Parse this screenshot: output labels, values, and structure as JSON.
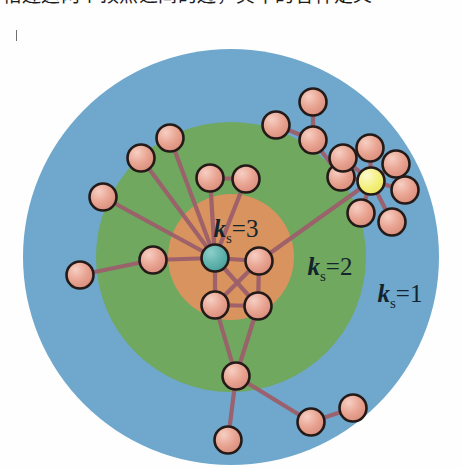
{
  "caption": {
    "text": "相连这两个顶点之间的边，其中的各种定义"
  },
  "figure": {
    "type": "k-shell decomposition network diagram",
    "title": "",
    "zones": [
      {
        "id": "shell-1",
        "label_k": "k",
        "label_sub": "s",
        "label_eq": "=1",
        "label_full": "k_s=1",
        "color": "#6fa8cc",
        "radius": 208,
        "label_x": 400,
        "label_y": 262
      },
      {
        "id": "shell-2",
        "label_k": "k",
        "label_sub": "s",
        "label_eq": "=2",
        "label_full": "k_s=2",
        "color": "#6fa85e",
        "radius": 135,
        "label_x": 330,
        "label_y": 235
      },
      {
        "id": "shell-3",
        "label_k": "k",
        "label_sub": "s",
        "label_eq": "=3",
        "label_full": "k_s=3",
        "color": "#d8935e",
        "radius": 63,
        "label_x": 236,
        "label_y": 197
      }
    ],
    "center": {
      "x": 231,
      "y": 217
    },
    "node_colors": {
      "normal_fill": "#e8a08e",
      "normal_highlight": "#f2c0b2",
      "center_fill": "#5fb2ad",
      "center_highlight": "#8fcdc9",
      "hub_fill": "#f4ef7a",
      "hub_highlight": "#f9f8c2",
      "stroke": "#241a18"
    },
    "edge_color": "#9d5f6b",
    "node_radius": 13.5,
    "nodes": [
      {
        "id": "n0",
        "x": 215,
        "y": 218,
        "kind": "center"
      },
      {
        "id": "n1",
        "x": 259,
        "y": 221,
        "kind": "normal"
      },
      {
        "id": "n2",
        "x": 215,
        "y": 265,
        "kind": "normal"
      },
      {
        "id": "n3",
        "x": 258,
        "y": 266,
        "kind": "normal"
      },
      {
        "id": "n4",
        "x": 153,
        "y": 220,
        "kind": "normal"
      },
      {
        "id": "n5",
        "x": 80,
        "y": 235,
        "kind": "normal"
      },
      {
        "id": "n6",
        "x": 103,
        "y": 157,
        "kind": "normal"
      },
      {
        "id": "n7",
        "x": 141,
        "y": 118,
        "kind": "normal"
      },
      {
        "id": "n8",
        "x": 170,
        "y": 98,
        "kind": "normal"
      },
      {
        "id": "n9",
        "x": 210,
        "y": 138,
        "kind": "normal"
      },
      {
        "id": "n10",
        "x": 246,
        "y": 139,
        "kind": "normal"
      },
      {
        "id": "n11",
        "x": 236,
        "y": 336,
        "kind": "normal"
      },
      {
        "id": "n12",
        "x": 228,
        "y": 400,
        "kind": "normal"
      },
      {
        "id": "n13",
        "x": 311,
        "y": 382,
        "kind": "normal"
      },
      {
        "id": "n14",
        "x": 353,
        "y": 368,
        "kind": "normal"
      },
      {
        "id": "n15",
        "x": 371,
        "y": 141,
        "kind": "hub"
      },
      {
        "id": "n16",
        "x": 341,
        "y": 137,
        "kind": "normal"
      },
      {
        "id": "n17",
        "x": 343,
        "y": 118,
        "kind": "normal"
      },
      {
        "id": "n18",
        "x": 370,
        "y": 108,
        "kind": "normal"
      },
      {
        "id": "n19",
        "x": 396,
        "y": 124,
        "kind": "normal"
      },
      {
        "id": "n20",
        "x": 405,
        "y": 150,
        "kind": "normal"
      },
      {
        "id": "n21",
        "x": 392,
        "y": 182,
        "kind": "normal"
      },
      {
        "id": "n22",
        "x": 361,
        "y": 173,
        "kind": "normal"
      },
      {
        "id": "n23",
        "x": 313,
        "y": 100,
        "kind": "normal"
      },
      {
        "id": "n24",
        "x": 276,
        "y": 85,
        "kind": "normal"
      },
      {
        "id": "n25",
        "x": 313,
        "y": 62,
        "kind": "normal"
      }
    ],
    "edges": [
      [
        "n0",
        "n1"
      ],
      [
        "n0",
        "n2"
      ],
      [
        "n0",
        "n3"
      ],
      [
        "n1",
        "n2"
      ],
      [
        "n1",
        "n3"
      ],
      [
        "n2",
        "n3"
      ],
      [
        "n0",
        "n4"
      ],
      [
        "n4",
        "n5"
      ],
      [
        "n0",
        "n6"
      ],
      [
        "n0",
        "n7"
      ],
      [
        "n0",
        "n8"
      ],
      [
        "n0",
        "n9"
      ],
      [
        "n0",
        "n10"
      ],
      [
        "n9",
        "n10"
      ],
      [
        "n2",
        "n11"
      ],
      [
        "n3",
        "n11"
      ],
      [
        "n11",
        "n12"
      ],
      [
        "n11",
        "n13"
      ],
      [
        "n13",
        "n14"
      ],
      [
        "n1",
        "n15"
      ],
      [
        "n15",
        "n16"
      ],
      [
        "n15",
        "n17"
      ],
      [
        "n15",
        "n18"
      ],
      [
        "n15",
        "n19"
      ],
      [
        "n15",
        "n20"
      ],
      [
        "n15",
        "n21"
      ],
      [
        "n15",
        "n22"
      ],
      [
        "n16",
        "n23"
      ],
      [
        "n23",
        "n24"
      ],
      [
        "n23",
        "n25"
      ]
    ]
  }
}
